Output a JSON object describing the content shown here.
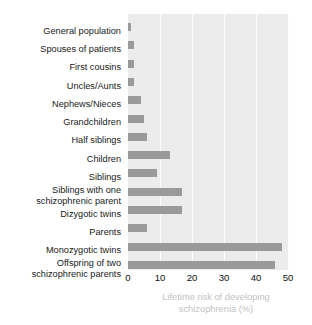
{
  "chart_data": {
    "type": "bar",
    "orientation": "horizontal",
    "title": "",
    "xlabel": "Lifetime risk of developing\nschizophrenia (%)",
    "ylabel": "",
    "xlim": [
      0,
      50
    ],
    "xticks": [
      0,
      10,
      20,
      30,
      40,
      50
    ],
    "xtick_labels": [
      "0",
      "10",
      "20",
      "30",
      "40",
      "50"
    ],
    "grid": true,
    "grid_axis": "x",
    "legend": false,
    "categories": [
      "General population",
      "Spouses of patients",
      "First cousins",
      "Uncles/Aunts",
      "Nephews/Nieces",
      "Grandchildren",
      "Half siblings",
      "Children",
      "Siblings",
      "Siblings with one\nschizophrenic parent",
      "Dizygotic twins",
      "Parents",
      "Monozygotic twins",
      "Offspring of two\nschizophrenic parents"
    ],
    "values": [
      1,
      2,
      2,
      2,
      4,
      5,
      6,
      13,
      9,
      17,
      17,
      6,
      48,
      46
    ],
    "colors": {
      "bar": "#9a9a9a",
      "plot_background": "#ececed",
      "gridline": "#fdfdfd",
      "category_label": "#1a1a1a",
      "tick_label": "#111111",
      "axis_title": "#c3c3c3"
    }
  }
}
